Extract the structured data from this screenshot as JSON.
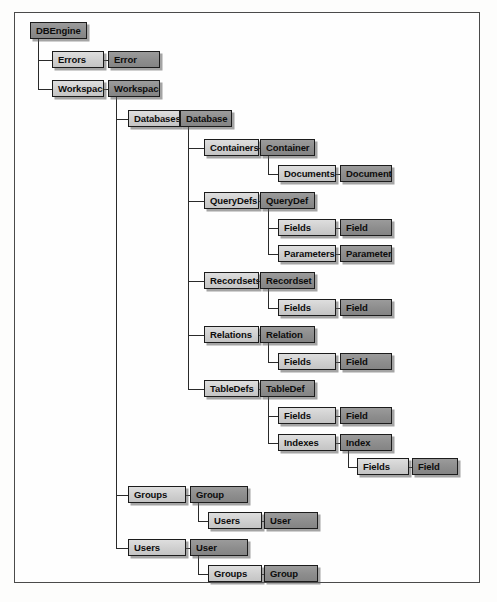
{
  "diagram": {
    "type": "tree",
    "colors": {
      "collection_fill": "#cfcfcf",
      "object_fill": "#8d8d8d",
      "border": "#1c1c1c",
      "connector": "#2a2a2a",
      "frame_border": "#4a4a4a",
      "page_background": "#fdfdfc"
    },
    "legend": {
      "collection_style": "light gray box",
      "object_style": "dark gray box"
    },
    "nodes": [
      {
        "id": "dbengine",
        "label": "DBEngine",
        "kind": "object",
        "x": 30,
        "y": 22,
        "w": 57
      },
      {
        "id": "errors",
        "label": "Errors",
        "kind": "collection",
        "x": 52,
        "y": 51,
        "w": 52
      },
      {
        "id": "error",
        "label": "Error",
        "kind": "object",
        "x": 108,
        "y": 51,
        "w": 52
      },
      {
        "id": "workspaces",
        "label": "Workspaces",
        "kind": "collection",
        "x": 52,
        "y": 80,
        "w": 52
      },
      {
        "id": "workspace",
        "label": "Workspace",
        "kind": "object",
        "x": 108,
        "y": 80,
        "w": 52
      },
      {
        "id": "databases",
        "label": "Databases",
        "kind": "collection",
        "x": 128,
        "y": 110,
        "w": 52
      },
      {
        "id": "database",
        "label": "Database",
        "kind": "object",
        "x": 180,
        "y": 110,
        "w": 52
      },
      {
        "id": "containers",
        "label": "Containers",
        "kind": "collection",
        "x": 204,
        "y": 139,
        "w": 55
      },
      {
        "id": "container",
        "label": "Container",
        "kind": "object",
        "x": 260,
        "y": 139,
        "w": 55
      },
      {
        "id": "documents",
        "label": "Documents",
        "kind": "collection",
        "x": 278,
        "y": 165,
        "w": 58
      },
      {
        "id": "document",
        "label": "Document",
        "kind": "object",
        "x": 340,
        "y": 165,
        "w": 52
      },
      {
        "id": "querydefs",
        "label": "QueryDefs",
        "kind": "collection",
        "x": 204,
        "y": 192,
        "w": 55
      },
      {
        "id": "querydef",
        "label": "QueryDef",
        "kind": "object",
        "x": 260,
        "y": 192,
        "w": 55
      },
      {
        "id": "qd_fields",
        "label": "Fields",
        "kind": "collection",
        "x": 278,
        "y": 219,
        "w": 58
      },
      {
        "id": "qd_field",
        "label": "Field",
        "kind": "object",
        "x": 340,
        "y": 219,
        "w": 52
      },
      {
        "id": "parameters",
        "label": "Parameters",
        "kind": "collection",
        "x": 278,
        "y": 245,
        "w": 58
      },
      {
        "id": "parameter",
        "label": "Parameter",
        "kind": "object",
        "x": 340,
        "y": 245,
        "w": 52
      },
      {
        "id": "recordsets",
        "label": "Recordsets",
        "kind": "collection",
        "x": 204,
        "y": 272,
        "w": 55
      },
      {
        "id": "recordset",
        "label": "Recordset",
        "kind": "object",
        "x": 260,
        "y": 272,
        "w": 55
      },
      {
        "id": "rs_fields",
        "label": "Fields",
        "kind": "collection",
        "x": 278,
        "y": 299,
        "w": 58
      },
      {
        "id": "rs_field",
        "label": "Field",
        "kind": "object",
        "x": 340,
        "y": 299,
        "w": 52
      },
      {
        "id": "relations",
        "label": "Relations",
        "kind": "collection",
        "x": 204,
        "y": 326,
        "w": 55
      },
      {
        "id": "relation",
        "label": "Relation",
        "kind": "object",
        "x": 260,
        "y": 326,
        "w": 55
      },
      {
        "id": "rel_fields",
        "label": "Fields",
        "kind": "collection",
        "x": 278,
        "y": 353,
        "w": 58
      },
      {
        "id": "rel_field",
        "label": "Field",
        "kind": "object",
        "x": 340,
        "y": 353,
        "w": 52
      },
      {
        "id": "tabledefs",
        "label": "TableDefs",
        "kind": "collection",
        "x": 204,
        "y": 380,
        "w": 55
      },
      {
        "id": "tabledef",
        "label": "TableDef",
        "kind": "object",
        "x": 260,
        "y": 380,
        "w": 55
      },
      {
        "id": "td_fields",
        "label": "Fields",
        "kind": "collection",
        "x": 278,
        "y": 407,
        "w": 58
      },
      {
        "id": "td_field",
        "label": "Field",
        "kind": "object",
        "x": 340,
        "y": 407,
        "w": 52
      },
      {
        "id": "indexes",
        "label": "Indexes",
        "kind": "collection",
        "x": 278,
        "y": 434,
        "w": 58
      },
      {
        "id": "index",
        "label": "Index",
        "kind": "object",
        "x": 340,
        "y": 434,
        "w": 52
      },
      {
        "id": "ix_fields",
        "label": "Fields",
        "kind": "collection",
        "x": 357,
        "y": 458,
        "w": 52
      },
      {
        "id": "ix_field",
        "label": "Field",
        "kind": "object",
        "x": 412,
        "y": 458,
        "w": 46
      },
      {
        "id": "groups",
        "label": "Groups",
        "kind": "collection",
        "x": 128,
        "y": 486,
        "w": 58
      },
      {
        "id": "group",
        "label": "Group",
        "kind": "object",
        "x": 190,
        "y": 486,
        "w": 58
      },
      {
        "id": "grp_users",
        "label": "Users",
        "kind": "collection",
        "x": 208,
        "y": 512,
        "w": 54
      },
      {
        "id": "grp_user",
        "label": "User",
        "kind": "object",
        "x": 264,
        "y": 512,
        "w": 54
      },
      {
        "id": "users",
        "label": "Users",
        "kind": "collection",
        "x": 128,
        "y": 539,
        "w": 58
      },
      {
        "id": "user",
        "label": "User",
        "kind": "object",
        "x": 190,
        "y": 539,
        "w": 58
      },
      {
        "id": "usr_groups",
        "label": "Groups",
        "kind": "collection",
        "x": 208,
        "y": 565,
        "w": 54
      },
      {
        "id": "usr_group",
        "label": "Group",
        "kind": "object",
        "x": 264,
        "y": 565,
        "w": 54
      }
    ],
    "edges": [
      {
        "from": "dbengine",
        "to": "errors",
        "style": "elbow"
      },
      {
        "from": "errors",
        "to": "error",
        "style": "straight"
      },
      {
        "from": "dbengine",
        "to": "workspaces",
        "style": "elbow"
      },
      {
        "from": "workspaces",
        "to": "workspace",
        "style": "straight"
      },
      {
        "from": "workspace",
        "to": "databases",
        "style": "elbow"
      },
      {
        "from": "databases",
        "to": "database",
        "style": "straight"
      },
      {
        "from": "workspace",
        "to": "groups",
        "style": "elbow"
      },
      {
        "from": "groups",
        "to": "group",
        "style": "straight"
      },
      {
        "from": "workspace",
        "to": "users",
        "style": "elbow"
      },
      {
        "from": "users",
        "to": "user",
        "style": "straight"
      },
      {
        "from": "database",
        "to": "containers",
        "style": "elbow"
      },
      {
        "from": "containers",
        "to": "container",
        "style": "straight"
      },
      {
        "from": "container",
        "to": "documents",
        "style": "elbow"
      },
      {
        "from": "documents",
        "to": "document",
        "style": "straight"
      },
      {
        "from": "database",
        "to": "querydefs",
        "style": "elbow"
      },
      {
        "from": "querydefs",
        "to": "querydef",
        "style": "straight"
      },
      {
        "from": "querydef",
        "to": "qd_fields",
        "style": "elbow"
      },
      {
        "from": "qd_fields",
        "to": "qd_field",
        "style": "straight"
      },
      {
        "from": "querydef",
        "to": "parameters",
        "style": "elbow"
      },
      {
        "from": "parameters",
        "to": "parameter",
        "style": "straight"
      },
      {
        "from": "database",
        "to": "recordsets",
        "style": "elbow"
      },
      {
        "from": "recordsets",
        "to": "recordset",
        "style": "straight"
      },
      {
        "from": "recordset",
        "to": "rs_fields",
        "style": "elbow"
      },
      {
        "from": "rs_fields",
        "to": "rs_field",
        "style": "straight"
      },
      {
        "from": "database",
        "to": "relations",
        "style": "elbow"
      },
      {
        "from": "relations",
        "to": "relation",
        "style": "straight"
      },
      {
        "from": "relation",
        "to": "rel_fields",
        "style": "elbow"
      },
      {
        "from": "rel_fields",
        "to": "rel_field",
        "style": "straight"
      },
      {
        "from": "database",
        "to": "tabledefs",
        "style": "elbow"
      },
      {
        "from": "tabledefs",
        "to": "tabledef",
        "style": "straight"
      },
      {
        "from": "tabledef",
        "to": "td_fields",
        "style": "elbow"
      },
      {
        "from": "td_fields",
        "to": "td_field",
        "style": "straight"
      },
      {
        "from": "tabledef",
        "to": "indexes",
        "style": "elbow"
      },
      {
        "from": "indexes",
        "to": "index",
        "style": "straight"
      },
      {
        "from": "index",
        "to": "ix_fields",
        "style": "elbow"
      },
      {
        "from": "ix_fields",
        "to": "ix_field",
        "style": "straight"
      },
      {
        "from": "group",
        "to": "grp_users",
        "style": "elbow"
      },
      {
        "from": "grp_users",
        "to": "grp_user",
        "style": "straight"
      },
      {
        "from": "user",
        "to": "usr_groups",
        "style": "elbow"
      },
      {
        "from": "usr_groups",
        "to": "usr_group",
        "style": "straight"
      }
    ]
  }
}
